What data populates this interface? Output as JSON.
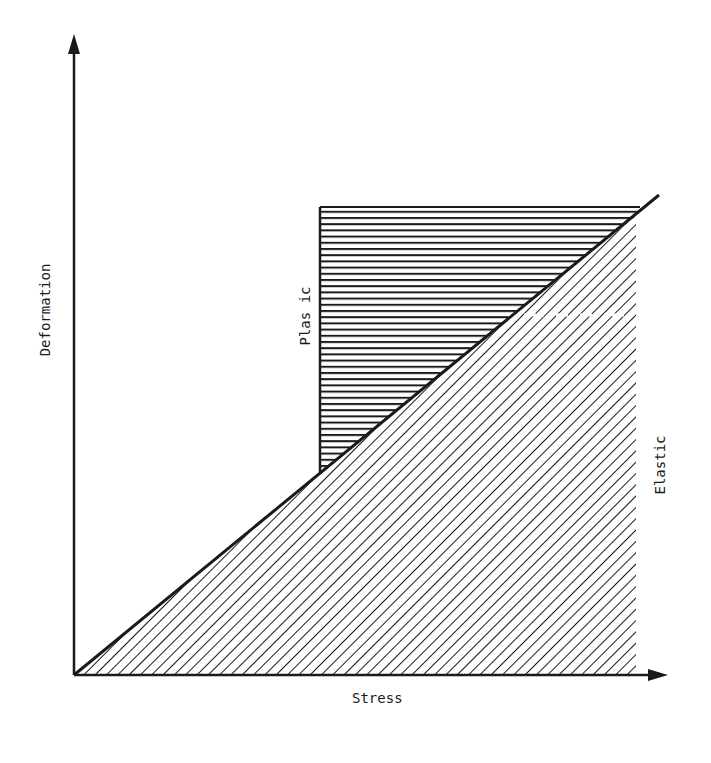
{
  "diagram": {
    "title": "",
    "x_axis_label": "Stress",
    "y_axis_label": "Deformation",
    "regions": [
      {
        "name": "plastic",
        "label": "Plas ic",
        "hatch": "horizontal"
      },
      {
        "name": "elastic",
        "label": "Elastic",
        "hatch": "diagonal"
      }
    ],
    "colors": {
      "ink": "#1a1a1a",
      "background": "#ffffff"
    }
  }
}
